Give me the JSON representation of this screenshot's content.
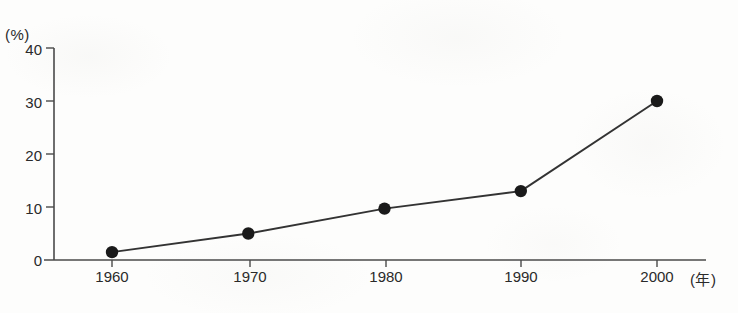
{
  "chart_data": {
    "type": "line",
    "title": "",
    "xlabel": "(年)",
    "ylabel": "(%)",
    "x": [
      1960,
      1970,
      1980,
      1990,
      2000
    ],
    "categories": [
      "1960",
      "1970",
      "1980",
      "1990",
      "2000"
    ],
    "values": [
      1.5,
      5.0,
      9.7,
      13.0,
      30.0
    ],
    "series": [
      {
        "name": "",
        "values": [
          1.5,
          5.0,
          9.7,
          13.0,
          30.0
        ]
      }
    ],
    "xlim": [
      1955,
      2005
    ],
    "ylim": [
      0,
      40
    ],
    "y_ticks": [
      0,
      10,
      20,
      30,
      40
    ],
    "y_tick_labels": [
      "0",
      "10",
      "20",
      "30",
      "40"
    ],
    "x_ticks": [
      1960,
      1970,
      1980,
      1990,
      2000
    ],
    "x_tick_labels": [
      "1960",
      "1970",
      "1980",
      "1990",
      "2000"
    ],
    "grid": false,
    "legend": false,
    "legend_position": "none",
    "marker": "filled-circle",
    "line_color": "#333333",
    "marker_color": "#1a1a1a",
    "axis_color": "#4a4a4a",
    "background_color": "#fdfdfc"
  },
  "axes": {
    "y_unit": "(%)",
    "x_unit": "(年)"
  },
  "y_labels": [
    {
      "value": 40,
      "text": "40"
    },
    {
      "value": 30,
      "text": "30"
    },
    {
      "value": 20,
      "text": "20"
    },
    {
      "value": 10,
      "text": "10"
    },
    {
      "value": 0,
      "text": "0"
    }
  ],
  "x_labels": [
    {
      "value": 1960,
      "text": "1960"
    },
    {
      "value": 1970,
      "text": "1970"
    },
    {
      "value": 1980,
      "text": "1980"
    },
    {
      "value": 1990,
      "text": "1990"
    },
    {
      "value": 2000,
      "text": "2000"
    }
  ]
}
